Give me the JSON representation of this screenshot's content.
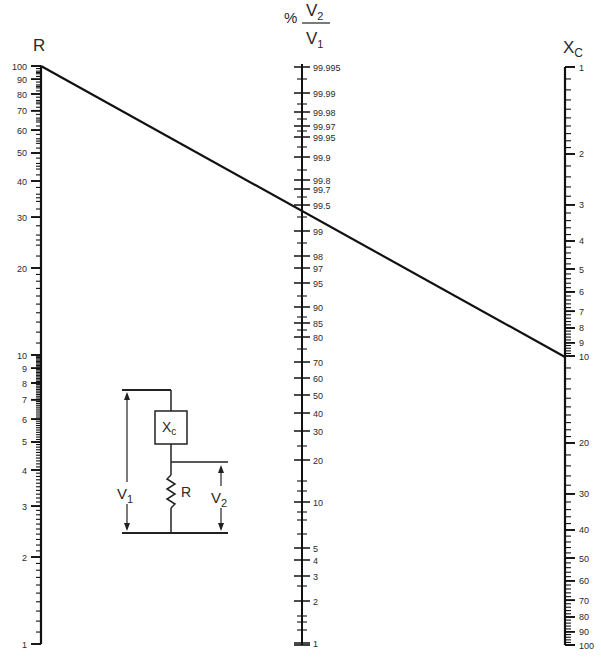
{
  "axes": {
    "r": {
      "label": "R",
      "x": 41,
      "top_y": 66,
      "bottom_y": 644,
      "min": 1,
      "max": 100,
      "ticks": [
        "100",
        "90",
        "80",
        "70",
        "60",
        "50",
        "40",
        "30",
        "20",
        "10",
        "9",
        "8",
        "7",
        "6",
        "5",
        "4",
        "3",
        "2",
        "1"
      ],
      "tick_values": [
        100,
        90,
        80,
        70,
        60,
        50,
        40,
        30,
        20,
        10,
        9,
        8,
        7,
        6,
        5,
        4,
        3,
        2,
        1
      ]
    },
    "ratio": {
      "label_prefix": "%",
      "label_num": "V",
      "label_num_sub": "2",
      "label_den": "V",
      "label_den_sub": "1",
      "x": 302,
      "ticks": [
        {
          "t": "99.995",
          "y": 67
        },
        {
          "t": "99.99",
          "y": 93
        },
        {
          "t": "99.98",
          "y": 112
        },
        {
          "t": "99.97",
          "y": 126
        },
        {
          "t": "99.95",
          "y": 137
        },
        {
          "t": "99.9",
          "y": 157
        },
        {
          "t": "99.8",
          "y": 180
        },
        {
          "t": "99.7",
          "y": 189
        },
        {
          "t": "99.5",
          "y": 205
        },
        {
          "t": "99",
          "y": 231
        },
        {
          "t": "98",
          "y": 256
        },
        {
          "t": "97",
          "y": 268
        },
        {
          "t": "95",
          "y": 283
        },
        {
          "t": "90",
          "y": 307
        },
        {
          "t": "85",
          "y": 323
        },
        {
          "t": "80",
          "y": 337
        },
        {
          "t": "70",
          "y": 362
        },
        {
          "t": "60",
          "y": 378
        },
        {
          "t": "50",
          "y": 395
        },
        {
          "t": "40",
          "y": 413
        },
        {
          "t": "30",
          "y": 431
        },
        {
          "t": "20",
          "y": 460
        },
        {
          "t": "10",
          "y": 502
        },
        {
          "t": "5",
          "y": 548
        },
        {
          "t": "4",
          "y": 560
        },
        {
          "t": "3",
          "y": 576
        },
        {
          "t": "2",
          "y": 601
        },
        {
          "t": "1",
          "y": 643
        }
      ],
      "minor_y": [
        79,
        104,
        119,
        131,
        147,
        170,
        197,
        217,
        243,
        296,
        317,
        330,
        349,
        446,
        481,
        491,
        512,
        520,
        534,
        586,
        616,
        622,
        630
      ]
    },
    "xc": {
      "label": "X",
      "label_sub": "C",
      "x": 565,
      "top_y": 67,
      "bottom_y": 645,
      "min": 1,
      "max": 100,
      "ticks": [
        "1",
        "2",
        "3",
        "4",
        "5",
        "6",
        "7",
        "8",
        "9",
        "10",
        "20",
        "30",
        "40",
        "50",
        "60",
        "70",
        "80",
        "90",
        "100"
      ],
      "tick_values": [
        1,
        2,
        3,
        4,
        5,
        6,
        7,
        8,
        9,
        10,
        20,
        30,
        40,
        50,
        60,
        70,
        80,
        90,
        100
      ]
    }
  },
  "example_line": {
    "r_value": 100,
    "ratio_value": 99.5,
    "xc_value": 10
  },
  "circuit": {
    "xc_label": "X",
    "xc_sub": "c",
    "r_label": "R",
    "v1_label": "V",
    "v1_sub": "1",
    "v2_label": "V",
    "v2_sub": "2"
  },
  "chart_data": {
    "type": "nomograph",
    "title": "",
    "scales": [
      {
        "name": "R",
        "scale": "log",
        "range": [
          1,
          100
        ],
        "ticks": [
          1,
          2,
          3,
          4,
          5,
          6,
          7,
          8,
          9,
          10,
          20,
          30,
          40,
          50,
          60,
          70,
          80,
          90,
          100
        ]
      },
      {
        "name": "% V2/V1",
        "scale": "nonlinear",
        "range": [
          1,
          99.995
        ],
        "ticks": [
          99.995,
          99.99,
          99.98,
          99.97,
          99.95,
          99.9,
          99.8,
          99.7,
          99.5,
          99,
          98,
          97,
          95,
          90,
          85,
          80,
          70,
          60,
          50,
          40,
          30,
          20,
          10,
          5,
          4,
          3,
          2,
          1
        ]
      },
      {
        "name": "Xc",
        "scale": "log",
        "range": [
          1,
          100
        ],
        "ticks": [
          1,
          2,
          3,
          4,
          5,
          6,
          7,
          8,
          9,
          10,
          20,
          30,
          40,
          50,
          60,
          70,
          80,
          90,
          100
        ]
      }
    ],
    "example_isopleth": {
      "R": 100,
      "%V2/V1": 99.5,
      "Xc": 10
    },
    "inset": "series circuit: Xc over R, V1 across both, V2 across R"
  }
}
